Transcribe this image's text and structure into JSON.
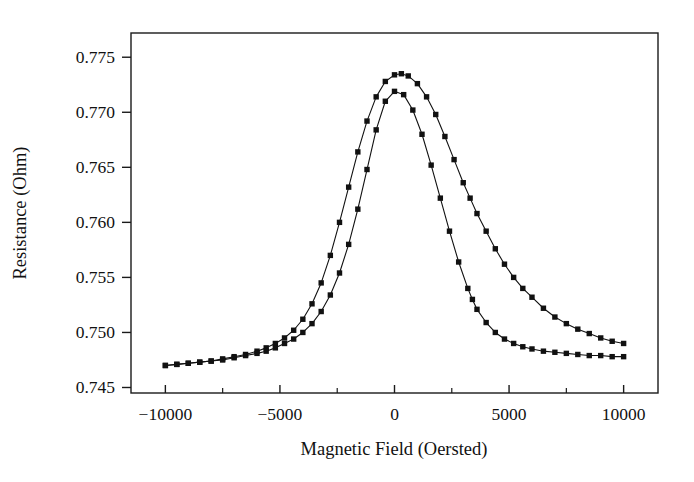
{
  "chart_data": {
    "type": "line",
    "title": "",
    "xlabel": "Magnetic Field (Oersted)",
    "ylabel": "Resistance (Ohm)",
    "xlim": [
      -11500,
      11500
    ],
    "ylim": [
      0.7445,
      0.7772
    ],
    "xticks": [
      -10000,
      -5000,
      0,
      5000,
      10000
    ],
    "xtick_labels": [
      "−10000",
      "−5000",
      "0",
      "5000",
      "10000"
    ],
    "yticks": [
      0.745,
      0.75,
      0.755,
      0.76,
      0.765,
      0.77,
      0.775
    ],
    "ytick_labels": [
      "0.745",
      "0.750",
      "0.755",
      "0.760",
      "0.765",
      "0.770",
      "0.775"
    ],
    "x_minor_ticks": [
      -7500,
      -2500,
      2500,
      7500
    ],
    "grid": false,
    "legend": "none",
    "marker": "square",
    "marker_color": "#111111",
    "line_color": "#111111",
    "series": [
      {
        "name": "ascending-sweep",
        "x": [
          -10000,
          -9500,
          -9000,
          -8500,
          -8000,
          -7500,
          -7000,
          -6500,
          -6000,
          -5600,
          -5200,
          -4800,
          -4400,
          -4000,
          -3600,
          -3200,
          -2800,
          -2400,
          -2000,
          -1600,
          -1200,
          -800,
          -400,
          0,
          300,
          600,
          1000,
          1400,
          1800,
          2200,
          2600,
          3000,
          3300,
          3600,
          4000,
          4400,
          4800,
          5200,
          5600,
          6000,
          6500,
          7000,
          7500,
          8000,
          8500,
          9000,
          9500,
          10000
        ],
        "y": [
          0.747,
          0.7471,
          0.7472,
          0.7473,
          0.7474,
          0.7476,
          0.7478,
          0.748,
          0.7483,
          0.7486,
          0.749,
          0.7495,
          0.7502,
          0.7512,
          0.7526,
          0.7545,
          0.757,
          0.76,
          0.7632,
          0.7664,
          0.7692,
          0.7714,
          0.7728,
          0.7734,
          0.7735,
          0.7733,
          0.7726,
          0.7714,
          0.7698,
          0.7678,
          0.7657,
          0.7636,
          0.7622,
          0.7608,
          0.7592,
          0.7576,
          0.7562,
          0.755,
          0.754,
          0.7532,
          0.7522,
          0.7514,
          0.7508,
          0.7503,
          0.7499,
          0.7495,
          0.7492,
          0.749
        ]
      },
      {
        "name": "descending-sweep",
        "x": [
          -10000,
          -9500,
          -9000,
          -8500,
          -8000,
          -7500,
          -7000,
          -6500,
          -6000,
          -5600,
          -5200,
          -4800,
          -4400,
          -4000,
          -3600,
          -3200,
          -2800,
          -2400,
          -2000,
          -1600,
          -1200,
          -800,
          -400,
          0,
          400,
          800,
          1200,
          1600,
          2000,
          2400,
          2800,
          3200,
          3400,
          3600,
          4000,
          4400,
          4800,
          5200,
          5600,
          6000,
          6500,
          7000,
          7500,
          8000,
          8500,
          9000,
          9500,
          10000
        ],
        "y": [
          0.747,
          0.7471,
          0.7472,
          0.7473,
          0.7474,
          0.7475,
          0.7477,
          0.7479,
          0.7481,
          0.7483,
          0.7486,
          0.749,
          0.7494,
          0.75,
          0.7508,
          0.7519,
          0.7534,
          0.7554,
          0.758,
          0.7612,
          0.7648,
          0.7684,
          0.771,
          0.7719,
          0.7716,
          0.7702,
          0.768,
          0.7652,
          0.7622,
          0.7592,
          0.7564,
          0.754,
          0.753,
          0.7521,
          0.7509,
          0.75,
          0.7494,
          0.749,
          0.7487,
          0.7485,
          0.7483,
          0.7482,
          0.7481,
          0.748,
          0.7479,
          0.7479,
          0.7478,
          0.7478
        ]
      }
    ]
  }
}
